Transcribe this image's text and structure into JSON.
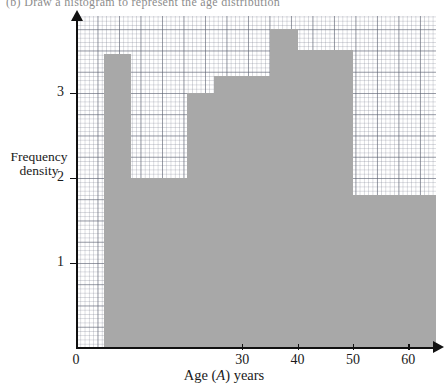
{
  "page": {
    "cropped_header_text": "(b) Draw a histogram to represent the age distribution"
  },
  "chart_data": {
    "type": "bar",
    "subtype": "histogram",
    "title": "",
    "xlabel": "Age (A) years",
    "xlabel_parts": {
      "prefix": "Age (",
      "italic": "A",
      "suffix": ") years"
    },
    "ylabel": "Frequency density",
    "ylabel_line1": "Frequency",
    "ylabel_line2": "density",
    "xlim": [
      0,
      65
    ],
    "ylim": [
      0,
      3.9
    ],
    "xticks": [
      0,
      30,
      40,
      50,
      60
    ],
    "xticklabels": [
      "0",
      "30",
      "40",
      "50",
      "60"
    ],
    "yticks": [
      1,
      2,
      3
    ],
    "yticklabels": [
      "1",
      "2",
      "3"
    ],
    "grid": true,
    "grid_style": "graph-paper",
    "legend": "none",
    "bar_color": "#a8a8a8",
    "axis_color": "#111111",
    "bins": [
      {
        "label": "5-10",
        "x0": 5,
        "x1": 10,
        "density": 3.45
      },
      {
        "label": "10-20",
        "x0": 10,
        "x1": 20,
        "density": 2.0
      },
      {
        "label": "20-25",
        "x0": 20,
        "x1": 25,
        "density": 3.0
      },
      {
        "label": "25-35",
        "x0": 25,
        "x1": 35,
        "density": 3.2
      },
      {
        "label": "35-40",
        "x0": 35,
        "x1": 40,
        "density": 3.75
      },
      {
        "label": "40-50",
        "x0": 40,
        "x1": 50,
        "density": 3.5
      },
      {
        "label": "50-65",
        "x0": 50,
        "x1": 65,
        "density": 1.8
      }
    ]
  }
}
